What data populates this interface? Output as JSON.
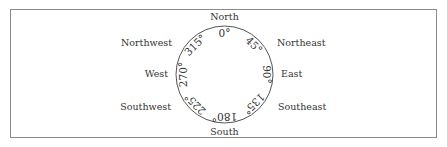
{
  "diagram": {
    "directions": [
      {
        "label": "North",
        "degrees": "0°"
      },
      {
        "label": "Northeast",
        "degrees": "45°"
      },
      {
        "label": "East",
        "degrees": "90°"
      },
      {
        "label": "Southeast",
        "degrees": "135°"
      },
      {
        "label": "South",
        "degrees": "180°"
      },
      {
        "label": "Southwest",
        "degrees": "225°"
      },
      {
        "label": "West",
        "degrees": "270°"
      },
      {
        "label": "Northwest",
        "degrees": "315°"
      }
    ]
  }
}
